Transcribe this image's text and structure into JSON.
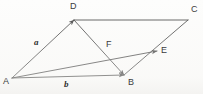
{
  "figure": {
    "kind": "geometry-vector-diagram",
    "background_color": "#fdfdfc",
    "line_color": "#4a4a4a",
    "label_color": "#3c3c3c",
    "width": 203,
    "height": 94,
    "points": [
      {
        "name": "A",
        "label": "A",
        "x": 12,
        "y": 78,
        "label_x": 3,
        "label_y": 77
      },
      {
        "name": "B",
        "label": "B",
        "x": 124,
        "y": 75,
        "label_x": 128,
        "label_y": 78
      },
      {
        "name": "C",
        "label": "C",
        "x": 188,
        "y": 20,
        "label_x": 191,
        "label_y": 5
      },
      {
        "name": "D",
        "label": "D",
        "x": 74,
        "y": 20,
        "label_x": 70,
        "label_y": 2
      },
      {
        "name": "E",
        "label": "E",
        "x": 157,
        "y": 51,
        "label_x": 161,
        "label_y": 46
      },
      {
        "name": "F",
        "label": "F",
        "x": 108,
        "y": 55,
        "label_x": 106,
        "label_y": 40
      }
    ],
    "segments": [
      {
        "name": "segment-A-D",
        "from": "A",
        "to": "D",
        "arrow_at_end": true
      },
      {
        "name": "segment-D-C",
        "from": "D",
        "to": "C",
        "arrow_at_end": false
      },
      {
        "name": "segment-A-B",
        "from": "A",
        "to": "B",
        "arrow_at_end": true
      },
      {
        "name": "segment-D-B",
        "from": "D",
        "to": "B",
        "arrow_at_end": true
      },
      {
        "name": "segment-A-E",
        "from": "A",
        "to": "E",
        "arrow_at_end": true
      },
      {
        "name": "segment-B-C",
        "from": "B",
        "to": "C",
        "arrow_at_end": false
      }
    ],
    "vector_labels": [
      {
        "name": "vector-label-a",
        "text": "a",
        "x": 34,
        "y": 38
      },
      {
        "name": "vector-label-b",
        "text": "b",
        "x": 64,
        "y": 80
      }
    ]
  }
}
